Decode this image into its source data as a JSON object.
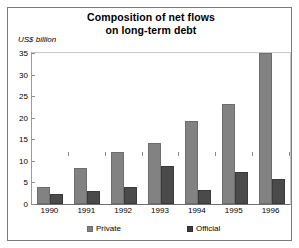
{
  "chart_data": {
    "type": "bar",
    "title": "Composition of net flows on long-term debt",
    "title_lines": [
      "Composition of net flows",
      "on long-term debt"
    ],
    "ylabel": "US$ billion",
    "xlabel": "",
    "categories": [
      "1990",
      "1991",
      "1992",
      "1993",
      "1994",
      "1995",
      "1996"
    ],
    "series": [
      {
        "name": "Private",
        "color": "#828282",
        "values": [
          4,
          8.4,
          12,
          14.2,
          19.3,
          23.2,
          35
        ]
      },
      {
        "name": "Official",
        "color": "#3c3c3c",
        "values": [
          2.3,
          3,
          4,
          8.8,
          3.3,
          7.4,
          5.8
        ]
      }
    ],
    "ylim": [
      0,
      35
    ],
    "yticks": [
      0,
      5,
      10,
      15,
      20,
      25,
      30,
      35
    ],
    "ytick_labels": [
      "0",
      "5",
      "10",
      "15",
      "20",
      "25",
      "30",
      "35"
    ],
    "grid": false,
    "legend_position": "bottom",
    "legend_entries": [
      "Private",
      "Official"
    ]
  }
}
